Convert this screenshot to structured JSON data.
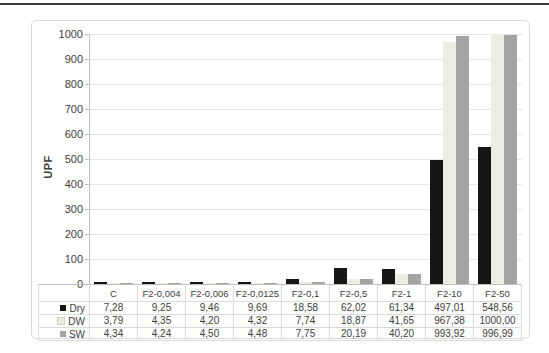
{
  "chart_data": {
    "type": "bar",
    "title": "",
    "xlabel": "",
    "ylabel": "UPF",
    "ylim": [
      0,
      1000
    ],
    "yticks": [
      0,
      100,
      200,
      300,
      400,
      500,
      600,
      700,
      800,
      900,
      1000
    ],
    "grid": true,
    "legend_position": "table-left",
    "categories": [
      "C",
      "F2-0,004",
      "F2-0,006",
      "F2-0,0125",
      "F2-0,1",
      "F2-0,5",
      "F2-1",
      "F2-10",
      "F2-50"
    ],
    "series": [
      {
        "name": "Dry",
        "color": "#161616",
        "values": [
          7.28,
          9.25,
          9.46,
          9.69,
          18.58,
          62.02,
          61.34,
          497.01,
          548.56
        ],
        "labels": [
          "7,28",
          "9,25",
          "9,46",
          "9,69",
          "18,58",
          "62,02",
          "61,34",
          "497,01",
          "548,56"
        ]
      },
      {
        "name": "DW",
        "color": "#edece2",
        "swatch_border": "#cfcfc6",
        "values": [
          3.79,
          4.35,
          4.2,
          4.32,
          7.74,
          18.87,
          41.65,
          967.38,
          1000.0
        ],
        "labels": [
          "3,79",
          "4,35",
          "4,20",
          "4,32",
          "7,74",
          "18,87",
          "41,65",
          "967,38",
          "1000,00"
        ]
      },
      {
        "name": "SW",
        "color": "#a3a3a1",
        "values": [
          4.34,
          4.24,
          4.5,
          4.48,
          7.75,
          20.19,
          40.2,
          993.92,
          996.99
        ],
        "labels": [
          "4,34",
          "4,24",
          "4,50",
          "4,48",
          "7,75",
          "20,19",
          "40,20",
          "993,92",
          "996,99"
        ]
      }
    ],
    "colors": {
      "gridline": "#e4e4e4",
      "axis": "#bfbfbf",
      "text": "#3d3d3d",
      "table_border": "#dadada",
      "top_rule": "#3b3b3b"
    }
  }
}
